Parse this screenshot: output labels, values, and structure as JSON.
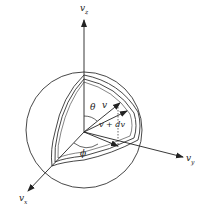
{
  "figure": {
    "type": "velocity-space spherical shell diagram",
    "axes": {
      "z": {
        "label": "v",
        "subscript": "z"
      },
      "y": {
        "label": "v",
        "subscript": "y"
      },
      "x": {
        "label": "v",
        "subscript": "x"
      }
    },
    "labels": {
      "theta": "θ",
      "v": "v",
      "v_plus_dv": "v + dv",
      "phi": "ϕ"
    },
    "caption": "",
    "colors": {
      "line": "#222222",
      "background": "#ffffff"
    }
  }
}
